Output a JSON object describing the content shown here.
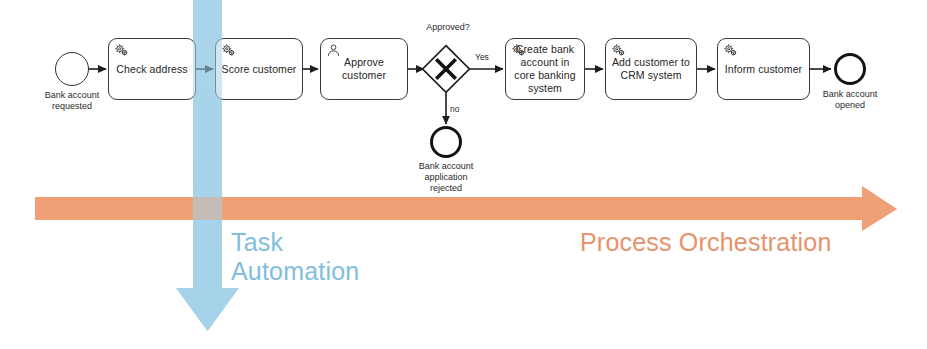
{
  "diagram": {
    "notation": "BPMN",
    "colors": {
      "blue_arrow": "#A8D4EA",
      "orange_arrow": "#EFA077",
      "blue_text": "#7FBEDC",
      "orange_text": "#E8916A",
      "stroke": "#2e2e2e",
      "background": "#ffffff"
    },
    "start_event": {
      "name": "start-event",
      "label": "Bank account\nrequested"
    },
    "tasks": [
      {
        "id": "check-address",
        "label": "Check address",
        "icon": "gear-icon",
        "type": "service-task"
      },
      {
        "id": "score-customer",
        "label": "Score customer",
        "icon": "gear-icon",
        "type": "service-task"
      },
      {
        "id": "approve-customer",
        "label": "Approve\ncustomer",
        "icon": "person-icon",
        "type": "user-task"
      },
      {
        "id": "create-bank-account",
        "label": "Create bank\naccount in core\nbanking system",
        "icon": "gear-icon",
        "type": "service-task"
      },
      {
        "id": "add-customer-crm",
        "label": "Add customer\nto CRM system",
        "icon": "gear-icon",
        "type": "service-task"
      },
      {
        "id": "inform-customer",
        "label": "Inform customer",
        "icon": "gear-icon",
        "type": "service-task"
      }
    ],
    "gateway": {
      "name": "exclusive-gateway",
      "label": "Approved?",
      "symbol": "X",
      "branches": [
        {
          "id": "yes-branch",
          "label": "Yes",
          "direction": "right"
        },
        {
          "id": "no-branch",
          "label": "no",
          "direction": "down"
        }
      ]
    },
    "end_events": [
      {
        "id": "end-rejected",
        "label": "Bank account\napplication\nrejected"
      },
      {
        "id": "end-opened",
        "label": "Bank account\nopened"
      }
    ],
    "annotations": [
      {
        "id": "task-automation",
        "label": "Task\nAutomation",
        "arrow": "down-arrow",
        "color": "#7FBEDC"
      },
      {
        "id": "process-orchestration",
        "label": "Process Orchestration",
        "arrow": "right-arrow",
        "color": "#E8916A"
      }
    ]
  }
}
